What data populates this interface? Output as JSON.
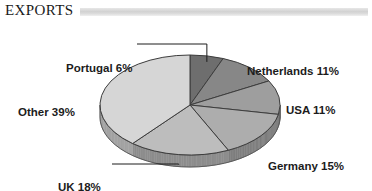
{
  "header": {
    "title": "EXPORTS",
    "rule_color": "#d2d2d2"
  },
  "chart_data": {
    "type": "pie",
    "title": "EXPORTS",
    "xlabel": "",
    "ylabel": "",
    "unit": "%",
    "style": "3d-pie",
    "legend_position": "outside-labels",
    "grid": false,
    "categories": [
      "Portugal",
      "Netherlands",
      "USA",
      "Germany",
      "UK",
      "Other"
    ],
    "values": [
      6,
      11,
      11,
      15,
      18,
      39
    ],
    "slices": [
      {
        "label": "Portugal 6%",
        "name": "Portugal",
        "value": 6,
        "color": "#6e6e6e",
        "side_color": "#4f4f4f",
        "leader": true
      },
      {
        "label": "Netherlands 11%",
        "name": "Netherlands",
        "value": 11,
        "color": "#878787",
        "side_color": "#616161",
        "leader": false
      },
      {
        "label": "USA 11%",
        "name": "USA",
        "value": 11,
        "color": "#9e9e9e",
        "side_color": "#747474",
        "leader": false
      },
      {
        "label": "Germany 15%",
        "name": "Germany",
        "value": 15,
        "color": "#adadad",
        "side_color": "#7f7f7f",
        "leader": false
      },
      {
        "label": "UK 18%",
        "name": "UK",
        "value": 18,
        "color": "#bdbdbd",
        "side_color": "#8d8d8d",
        "leader": true
      },
      {
        "label": "Other 39%",
        "name": "Other",
        "value": 39,
        "color": "#d6d6d6",
        "side_color": "#a3a3a3",
        "leader": false
      }
    ]
  }
}
